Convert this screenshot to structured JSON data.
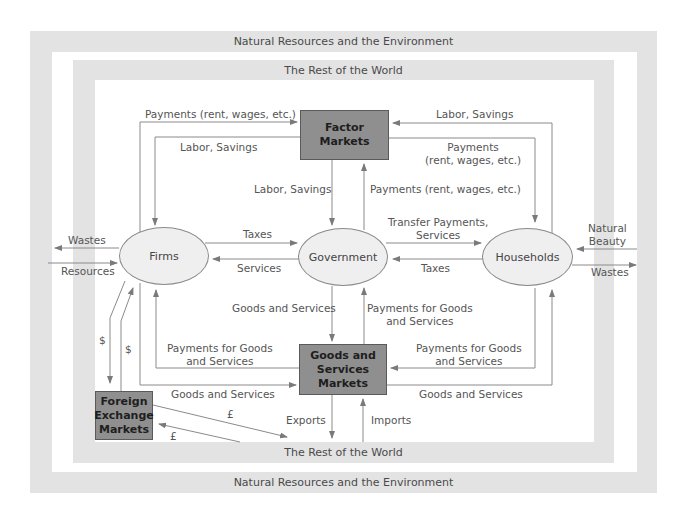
{
  "bands": {
    "outer_top": "Natural Resources and the Environment",
    "outer_bottom": "Natural Resources and the Environment",
    "inner_top": "The Rest of the World",
    "inner_bottom": "The Rest of the World"
  },
  "nodes": {
    "factor_markets": "Factor Markets",
    "goods_services_markets": [
      "Goods and",
      "Services",
      "Markets"
    ],
    "foreign_exchange": [
      "Foreign",
      "Exchange",
      "Markets"
    ],
    "firms": "Firms",
    "government": "Government",
    "households": "Households"
  },
  "flows": {
    "firms_to_factor_payments": "Payments (rent, wages, etc.)",
    "factor_to_firms_labor": "Labor, Savings",
    "households_to_factor_labor": "Labor, Savings",
    "factor_to_households_payments": [
      "Payments",
      "(rent, wages, etc.)"
    ],
    "factor_to_gov_labor": "Labor, Savings",
    "gov_to_factor_payments": "Payments (rent, wages, etc.)",
    "firms_to_gov_taxes": "Taxes",
    "gov_to_firms_services": "Services",
    "gov_to_households_transfer": [
      "Transfer Payments,",
      "Services"
    ],
    "households_to_gov_taxes": "Taxes",
    "firms_wastes": "Wastes",
    "firms_resources": "Resources",
    "households_natural_beauty": [
      "Natural",
      "Beauty"
    ],
    "households_wastes": "Wastes",
    "goods_to_gov": "Goods and Services",
    "gov_to_goods_payments": [
      "Payments for Goods",
      "and Services"
    ],
    "goods_to_firms_payments": [
      "Payments for Goods",
      "and Services"
    ],
    "firms_to_goods": "Goods and Services",
    "households_to_goods_payments": [
      "Payments for Goods",
      "and Services"
    ],
    "goods_to_households": "Goods and Services",
    "firms_to_forex_dollar": "$",
    "forex_to_firms_dollar": "$",
    "forex_pound_out": "£",
    "forex_pound_in": "£",
    "exports": "Exports",
    "imports": "Imports"
  },
  "colors": {
    "band": "#e3e3e3",
    "box_fill": "#8f8f8f",
    "ellipse_fill": "#efefef",
    "line": "#8a8a8a",
    "text": "#555555"
  }
}
